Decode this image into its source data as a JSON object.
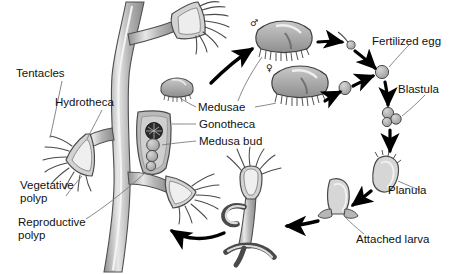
{
  "diagram": {
    "background": "#ffffff",
    "ink": "#111111",
    "palette": {
      "tissue_mid": "#9a9a9a",
      "tissue_light": "#d8d8d8",
      "tissue_pale": "#ececec",
      "tissue_dark": "#6e6e6e",
      "blastostyle_dark": "#2b2b2b",
      "leader_line": "#777777",
      "arrow": "#000000"
    }
  },
  "labels": {
    "tentacles": "Tentacles",
    "hydrotheca": "Hydrotheca",
    "vegetative_polyp_line1": "Vegetative",
    "vegetative_polyp_line2": "polyp",
    "reproductive_polyp_line1": "Reproductive",
    "reproductive_polyp_line2": "polyp",
    "medusae": "Medusae",
    "gonotheca": "Gonotheca",
    "medusa_bud": "Medusa bud",
    "fertilized_egg": "Fertilized egg",
    "blastula": "Blastula",
    "planula": "Planula",
    "attached_larva": "Attached larva"
  },
  "sex_symbols": {
    "male": "♂",
    "female": "♀"
  },
  "stages": [
    {
      "id": "colony",
      "label": "Vegetative polyp / Reproductive polyp"
    },
    {
      "id": "medusae",
      "label": "Medusae"
    },
    {
      "id": "gametes",
      "label": "Sperm and egg"
    },
    {
      "id": "fertilized-egg",
      "label": "Fertilized egg"
    },
    {
      "id": "blastula",
      "label": "Blastula"
    },
    {
      "id": "planula",
      "label": "Planula"
    },
    {
      "id": "attached-larva",
      "label": "Attached larva"
    },
    {
      "id": "young-polyp",
      "label": "Young polyp"
    }
  ]
}
